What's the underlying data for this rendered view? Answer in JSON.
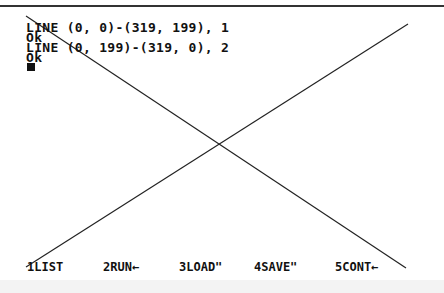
{
  "terminal": {
    "lines": [
      "LINE (0, 0)-(319, 199), 1",
      "Ok",
      "LINE (0, 199)-(319, 0), 2",
      "Ok"
    ]
  },
  "function_keys": [
    {
      "label": "1LIST"
    },
    {
      "label": "2RUN←"
    },
    {
      "label": "3LOAD\""
    },
    {
      "label": "4SAVE\""
    },
    {
      "label": "5CONT←"
    }
  ],
  "graphics": {
    "line1": {
      "x1": 26,
      "y1": 16,
      "x2": 406,
      "y2": 268,
      "color": "#222222"
    },
    "line2": {
      "x1": 26,
      "y1": 267,
      "x2": 408,
      "y2": 24,
      "color": "#222222"
    }
  }
}
